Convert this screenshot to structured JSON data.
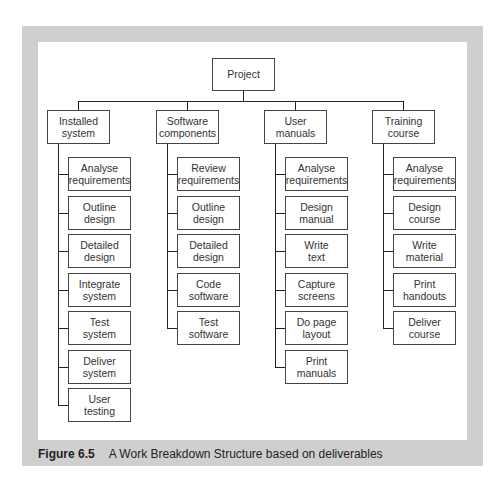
{
  "diagram": {
    "root": "Project",
    "branches": [
      {
        "label": "Installed\nsystem",
        "children": [
          "Analyse\nrequirements",
          "Outline\ndesign",
          "Detailed\ndesign",
          "Integrate\nsystem",
          "Test\nsystem",
          "Deliver\nsystem",
          "User\ntesting"
        ]
      },
      {
        "label": "Software\ncomponents",
        "children": [
          "Review\nrequirements",
          "Outline\ndesign",
          "Detailed\ndesign",
          "Code\nsoftware",
          "Test\nsoftware"
        ]
      },
      {
        "label": "User\nmanuals",
        "children": [
          "Analyse\nrequirements",
          "Design\nmanual",
          "Write\ntext",
          "Capture\nscreens",
          "Do page\nlayout",
          "Print\nmanuals"
        ]
      },
      {
        "label": "Training\ncourse",
        "children": [
          "Analyse\nrequirements",
          "Design\ncourse",
          "Write\nmaterial",
          "Print\nhandouts",
          "Deliver\ncourse"
        ]
      }
    ]
  },
  "caption": {
    "number": "Figure 6.5",
    "text": "A Work Breakdown Structure based on deliverables"
  },
  "colors": {
    "frame": "#cfcfcf",
    "line": "#222222",
    "box_border": "#444444"
  }
}
